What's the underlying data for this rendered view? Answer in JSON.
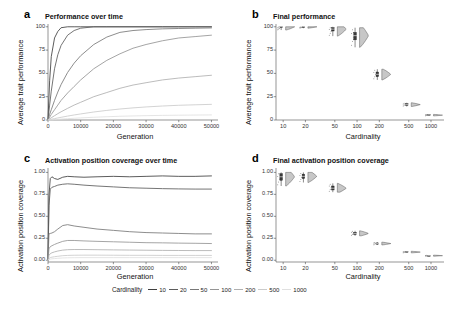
{
  "figure": {
    "width": 455,
    "height": 310,
    "background": "#ffffff"
  },
  "legend": {
    "title": "Cardinality",
    "entries": [
      {
        "label": "10",
        "color": "#3f3f3f"
      },
      {
        "label": "20",
        "color": "#5c5c5c"
      },
      {
        "label": "50",
        "color": "#787878"
      },
      {
        "label": "100",
        "color": "#959595"
      },
      {
        "label": "200",
        "color": "#b0b0b0"
      },
      {
        "label": "500",
        "color": "#cbcbcb"
      },
      {
        "label": "1000",
        "color": "#e0e0e0"
      }
    ]
  },
  "panels": {
    "a": {
      "letter": "a",
      "title": "Performance over time",
      "xlabel": "Generation",
      "ylabel": "Average trait performance"
    },
    "b": {
      "letter": "b",
      "title": "Final performance",
      "xlabel": "Cardinality",
      "ylabel": "Average trait performance"
    },
    "c": {
      "letter": "c",
      "title": "Activation position coverage over time",
      "xlabel": "Generation",
      "ylabel": "Activation position coverage"
    },
    "d": {
      "letter": "d",
      "title": "Final activation position coverage",
      "xlabel": "Cardinality",
      "ylabel": "Activation position coverage"
    }
  },
  "chart_data": [
    {
      "id": "panel-a",
      "type": "line",
      "title": "Performance over time",
      "xlabel": "Generation",
      "ylabel": "Average trait performance",
      "xlim": [
        0,
        52000
      ],
      "ylim": [
        0,
        103
      ],
      "xticks": [
        0,
        10000,
        20000,
        30000,
        40000,
        50000
      ],
      "xticklabels": [
        "0",
        "10000",
        "20000",
        "30000",
        "40000",
        "50000"
      ],
      "yticks": [
        0,
        25,
        50,
        75,
        100
      ],
      "yticklabels": [
        "0",
        "25",
        "50",
        "75",
        "100"
      ],
      "grid": false,
      "legend": "bottom",
      "x": [
        0,
        500,
        1000,
        2000,
        3000,
        4000,
        6000,
        8000,
        10000,
        14000,
        18000,
        22000,
        26000,
        30000,
        35000,
        40000,
        45000,
        50000
      ],
      "series": [
        {
          "name": "10",
          "color": "#3f3f3f",
          "values": [
            0,
            42,
            68,
            88,
            95,
            99,
            100,
            100,
            100,
            100,
            100,
            100,
            100,
            100,
            100,
            100,
            100,
            100
          ]
        },
        {
          "name": "20",
          "color": "#5c5c5c",
          "values": [
            0,
            16,
            31,
            55,
            70,
            80,
            91,
            96,
            98.5,
            100,
            100,
            100,
            100,
            100,
            100,
            100,
            100,
            100
          ]
        },
        {
          "name": "50",
          "color": "#787878",
          "values": [
            0,
            6,
            11,
            21,
            30,
            38,
            51,
            61,
            69,
            81,
            89,
            94,
            96,
            97,
            97.8,
            98.2,
            98.5,
            98.8
          ]
        },
        {
          "name": "100",
          "color": "#959595",
          "values": [
            0,
            3,
            6,
            11,
            16,
            21,
            29,
            36,
            43,
            55,
            64,
            71,
            77,
            81,
            85,
            88,
            89.5,
            91
          ]
        },
        {
          "name": "200",
          "color": "#b0b0b0",
          "values": [
            0,
            1.2,
            2.4,
            4.6,
            6.8,
            8.8,
            12.5,
            16,
            19,
            25,
            29.5,
            34,
            37.5,
            40,
            43,
            45,
            46.5,
            48
          ]
        },
        {
          "name": "500",
          "color": "#cbcbcb",
          "values": [
            0,
            0.4,
            0.8,
            1.5,
            2.2,
            2.9,
            4.2,
            5.4,
            6.5,
            8.6,
            10.3,
            11.8,
            13.0,
            14.0,
            15.0,
            15.8,
            16.3,
            16.8
          ]
        },
        {
          "name": "1000",
          "color": "#e0e0e0",
          "values": [
            0,
            0.12,
            0.25,
            0.5,
            0.75,
            1.0,
            1.45,
            1.85,
            2.25,
            2.95,
            3.5,
            4.0,
            4.35,
            4.65,
            4.95,
            5.15,
            5.3,
            5.45
          ]
        }
      ]
    },
    {
      "id": "panel-b",
      "type": "violin",
      "title": "Final performance",
      "xlabel": "Cardinality",
      "ylabel": "Average trait performance",
      "xscale": "log",
      "xlim": [
        8,
        1500
      ],
      "ylim": [
        0,
        103
      ],
      "xticks": [
        10,
        20,
        50,
        100,
        200,
        500,
        1000
      ],
      "xticklabels": [
        "10",
        "20",
        "50",
        "100",
        "200",
        "500",
        "1000"
      ],
      "yticks": [
        0,
        25,
        50,
        75,
        100
      ],
      "yticklabels": [
        "0",
        "25",
        "50",
        "75",
        "100"
      ],
      "grid": false,
      "categories": [
        "10",
        "20",
        "50",
        "100",
        "200",
        "500",
        "1000"
      ],
      "medians": [
        100,
        100,
        97.5,
        90.5,
        49.0,
        16.5,
        5.2
      ],
      "q1": [
        99.6,
        99.7,
        95.5,
        86.0,
        46.5,
        15.6,
        4.8
      ],
      "q3": [
        100,
        100,
        99.0,
        94.0,
        51.5,
        17.4,
        5.6
      ],
      "min": [
        96.5,
        98.5,
        90.0,
        78.0,
        43.0,
        14.5,
        4.4
      ],
      "max": [
        100,
        100,
        100,
        99.0,
        54.5,
        18.5,
        6.0
      ]
    },
    {
      "id": "panel-c",
      "type": "line",
      "title": "Activation position coverage over time",
      "xlabel": "Generation",
      "ylabel": "Activation position coverage",
      "xlim": [
        0,
        52000
      ],
      "ylim": [
        -0.02,
        1.05
      ],
      "xticks": [
        0,
        10000,
        20000,
        30000,
        40000,
        50000
      ],
      "xticklabels": [
        "0",
        "10000",
        "20000",
        "30000",
        "40000",
        "50000"
      ],
      "yticks": [
        0.0,
        0.25,
        0.5,
        0.75,
        1.0
      ],
      "yticklabels": [
        "0.00",
        "0.25",
        "0.50",
        "0.75",
        "1.00"
      ],
      "grid": false,
      "legend": "bottom",
      "x": [
        0,
        300,
        700,
        1200,
        2000,
        3000,
        4500,
        6000,
        8000,
        11000,
        15000,
        20000,
        25000,
        30000,
        35000,
        40000,
        45000,
        50000
      ],
      "series": [
        {
          "name": "10",
          "color": "#3f3f3f",
          "values": [
            0,
            0.74,
            0.93,
            0.95,
            0.93,
            0.92,
            0.945,
            0.955,
            0.95,
            0.945,
            0.95,
            0.955,
            0.95,
            0.955,
            0.96,
            0.955,
            0.955,
            0.96
          ]
        },
        {
          "name": "20",
          "color": "#5c5c5c",
          "values": [
            0,
            0.62,
            0.81,
            0.83,
            0.84,
            0.855,
            0.865,
            0.87,
            0.865,
            0.855,
            0.845,
            0.835,
            0.825,
            0.82,
            0.815,
            0.812,
            0.81,
            0.81
          ]
        },
        {
          "name": "50",
          "color": "#787878",
          "values": [
            0,
            0.3,
            0.305,
            0.31,
            0.325,
            0.355,
            0.395,
            0.405,
            0.39,
            0.375,
            0.355,
            0.34,
            0.325,
            0.315,
            0.31,
            0.305,
            0.3,
            0.3
          ]
        },
        {
          "name": "100",
          "color": "#959595",
          "values": [
            0,
            0.13,
            0.155,
            0.165,
            0.18,
            0.195,
            0.215,
            0.225,
            0.225,
            0.22,
            0.215,
            0.21,
            0.205,
            0.2,
            0.198,
            0.195,
            0.193,
            0.19
          ]
        },
        {
          "name": "200",
          "color": "#b0b0b0",
          "values": [
            0,
            0.055,
            0.075,
            0.085,
            0.095,
            0.105,
            0.115,
            0.12,
            0.122,
            0.122,
            0.12,
            0.118,
            0.116,
            0.114,
            0.112,
            0.111,
            0.11,
            0.11
          ]
        },
        {
          "name": "500",
          "color": "#cbcbcb",
          "values": [
            0,
            0.02,
            0.03,
            0.035,
            0.04,
            0.045,
            0.052,
            0.055,
            0.057,
            0.058,
            0.058,
            0.057,
            0.056,
            0.056,
            0.055,
            0.055,
            0.055,
            0.055
          ]
        },
        {
          "name": "1000",
          "color": "#e0e0e0",
          "values": [
            0,
            0.008,
            0.013,
            0.016,
            0.019,
            0.022,
            0.026,
            0.028,
            0.029,
            0.03,
            0.03,
            0.03,
            0.03,
            0.03,
            0.03,
            0.03,
            0.03,
            0.03
          ]
        }
      ]
    },
    {
      "id": "panel-d",
      "type": "violin",
      "title": "Final activation position coverage",
      "xlabel": "Cardinality",
      "ylabel": "Activation position coverage",
      "xscale": "log",
      "xlim": [
        8,
        1500
      ],
      "ylim": [
        -0.02,
        1.05
      ],
      "xticks": [
        10,
        20,
        50,
        100,
        200,
        500,
        1000
      ],
      "xticklabels": [
        "10",
        "20",
        "50",
        "100",
        "200",
        "500",
        "1000"
      ],
      "yticks": [
        0.0,
        0.25,
        0.5,
        0.75,
        1.0
      ],
      "yticklabels": [
        "0.00",
        "0.25",
        "0.50",
        "0.75",
        "1.00"
      ],
      "grid": false,
      "categories": [
        "10",
        "20",
        "50",
        "100",
        "200",
        "500",
        "1000"
      ],
      "medians": [
        0.95,
        0.955,
        0.82,
        0.305,
        0.19,
        0.093,
        0.052
      ],
      "q1": [
        0.91,
        0.93,
        0.8,
        0.293,
        0.183,
        0.089,
        0.049
      ],
      "q3": [
        0.985,
        0.98,
        0.845,
        0.318,
        0.197,
        0.097,
        0.055
      ],
      "min": [
        0.845,
        0.885,
        0.775,
        0.278,
        0.174,
        0.084,
        0.046
      ],
      "max": [
        1.0,
        1.0,
        0.875,
        0.335,
        0.206,
        0.102,
        0.058
      ]
    }
  ]
}
